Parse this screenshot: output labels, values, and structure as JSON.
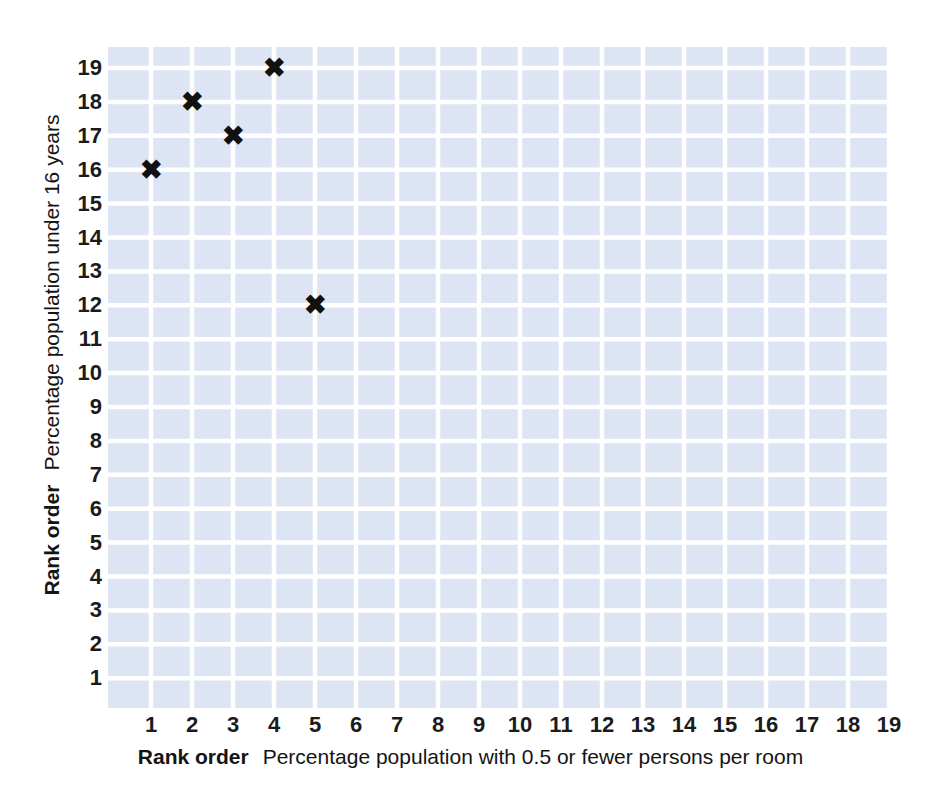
{
  "chart_data": {
    "type": "scatter",
    "title": "",
    "xlabel_bold": "Rank order",
    "xlabel": "Percentage population with 0.5 or fewer persons per room",
    "ylabel_bold": "Rank order",
    "ylabel": "Percentage population under 16 years",
    "x": [
      1,
      2,
      3,
      4,
      5
    ],
    "y": [
      16,
      18,
      17,
      19,
      12
    ],
    "points": [
      {
        "x": 1,
        "y": 16,
        "marker": "x-marker"
      },
      {
        "x": 2,
        "y": 18,
        "marker": "x-marker"
      },
      {
        "x": 3,
        "y": 17,
        "marker": "x-marker"
      },
      {
        "x": 4,
        "y": 19,
        "marker": "x-marker"
      },
      {
        "x": 5,
        "y": 12,
        "marker": "x-marker"
      }
    ],
    "marker_glyph": "✖",
    "xlim": [
      0.5,
      19.5
    ],
    "ylim": [
      0.5,
      19.5
    ],
    "xticks": [
      1,
      2,
      3,
      4,
      5,
      6,
      7,
      8,
      9,
      10,
      11,
      12,
      13,
      14,
      15,
      16,
      17,
      18,
      19
    ],
    "yticks": [
      1,
      2,
      3,
      4,
      5,
      6,
      7,
      8,
      9,
      10,
      11,
      12,
      13,
      14,
      15,
      16,
      17,
      18,
      19
    ],
    "grid": true,
    "legend": "none",
    "colors": {
      "plot_background": "#dde4f3",
      "gridline": "#ffffff",
      "marker": "#111111",
      "page_background": "#ffffff",
      "tick_label": "#1b1b1b",
      "axis_title": "#141414"
    }
  }
}
